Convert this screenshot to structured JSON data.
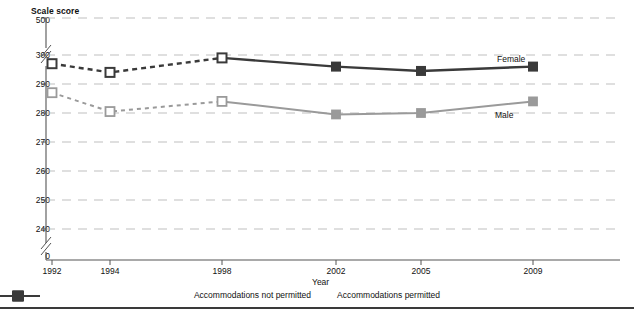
{
  "chart_data": {
    "type": "line",
    "title": "",
    "ylabel": "Scale score",
    "xlabel": "Year",
    "categories": [
      "1992",
      "1994",
      "1998",
      "2002",
      "2005",
      "2009"
    ],
    "ylim": [
      240,
      300
    ],
    "yticks": [
      "0",
      "240",
      "250",
      "260",
      "270",
      "280",
      "290",
      "300",
      "500"
    ],
    "grid": true,
    "axis_break": true,
    "legend_position": "bottom-center",
    "series": [
      {
        "name": "Female",
        "values": [
          297,
          294,
          299,
          296,
          294.5,
          296
        ],
        "color": "#3a3a3a",
        "dashed_through_index": 2
      },
      {
        "name": "Male",
        "values": [
          287,
          280.5,
          284,
          279.5,
          280,
          284
        ],
        "color": "#9a9a9a",
        "dashed_through_index": 2
      }
    ],
    "annotations": [
      {
        "text": "Female",
        "x": "2005",
        "series": "Female"
      },
      {
        "text": "Male",
        "x": "2005",
        "series": "Male"
      }
    ]
  },
  "chart": {
    "y_axis_title": "Scale score",
    "x_axis_title": "Year",
    "y_ticks": [
      "500",
      "300",
      "290",
      "280",
      "270",
      "260",
      "250",
      "240",
      "0"
    ],
    "x_ticks": [
      "1992",
      "1994",
      "1998",
      "2002",
      "2005",
      "2009"
    ],
    "series_label_female": "Female",
    "series_label_male": "Male"
  },
  "legend": {
    "items": [
      {
        "label": "Accommodations not permitted",
        "style": "dashed-open-square",
        "color": "#3a3a3a"
      },
      {
        "label": "Accommodations permitted",
        "style": "solid-filled-square",
        "color": "#3a3a3a"
      }
    ]
  },
  "colors": {
    "female_line": "#3a3a3a",
    "male_line": "#9a9a9a",
    "grid": "#b8b8b8",
    "axis": "#555555"
  }
}
